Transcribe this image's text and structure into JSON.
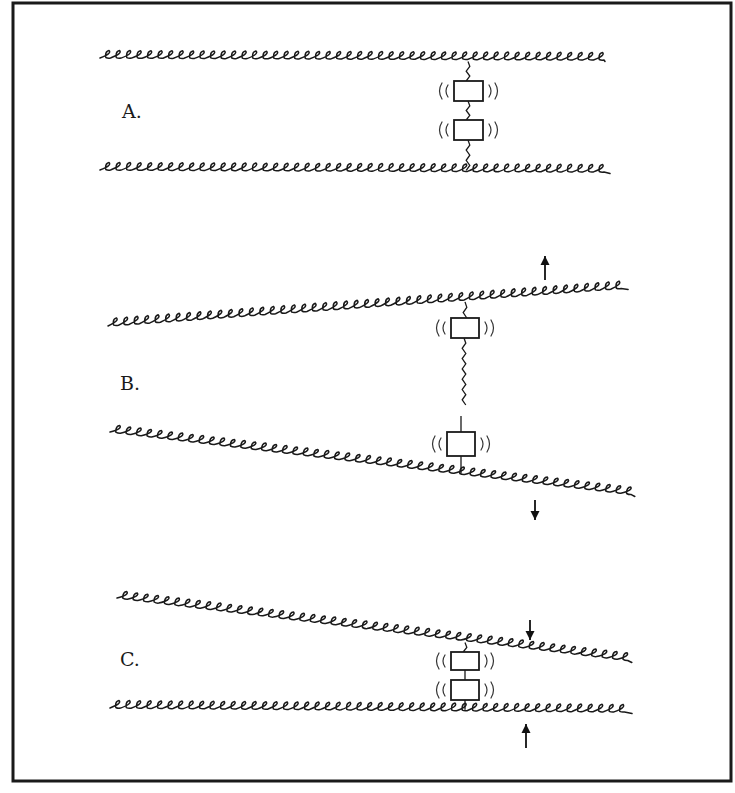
{
  "figure": {
    "border": {
      "x": 13,
      "y": 3,
      "width": 718,
      "height": 778,
      "color": "#1a1a1a"
    },
    "panels": [
      {
        "id": "A",
        "label": "A.",
        "label_pos": {
          "x": 122,
          "y": 100
        },
        "description": "Two parallel filaments linked by two vibrating blocks in series (contact state)",
        "filaments": [
          {
            "name": "top",
            "from": [
              100,
              58
            ],
            "to": [
              605,
              60
            ]
          },
          {
            "name": "bottom",
            "from": [
              100,
              170
            ],
            "to": [
              610,
              172
            ]
          }
        ],
        "blocks": [
          {
            "x": 454,
            "y": 81,
            "w": 29,
            "h": 20
          },
          {
            "x": 454,
            "y": 120,
            "w": 29,
            "h": 20
          }
        ],
        "tether_x": 468,
        "arrows": []
      },
      {
        "id": "B",
        "label": "B.",
        "label_pos": {
          "x": 120,
          "y": 372
        },
        "description": "Filaments pulled apart; the link between blocks is stretched",
        "filaments": [
          {
            "name": "top",
            "from": [
              108,
              326
            ],
            "to": [
              628,
              288
            ]
          },
          {
            "name": "bottom",
            "from": [
              110,
              432
            ],
            "to": [
              635,
              495
            ]
          }
        ],
        "blocks": [
          {
            "x": 451,
            "y": 318,
            "w": 28,
            "h": 20
          },
          {
            "x": 447,
            "y": 432,
            "w": 28,
            "h": 24
          }
        ],
        "tether_x": 465,
        "arrows": [
          {
            "direction": "up",
            "x": 545,
            "y1": 280,
            "y2": 256
          },
          {
            "direction": "down",
            "x": 535,
            "y1": 500,
            "y2": 520
          }
        ]
      },
      {
        "id": "C",
        "label": "C.",
        "label_pos": {
          "x": 120,
          "y": 648
        },
        "description": "Filaments pushed together; blocks compressed into contact",
        "filaments": [
          {
            "name": "top",
            "from": [
              117,
              598
            ],
            "to": [
              632,
              661
            ]
          },
          {
            "name": "bottom",
            "from": [
              110,
              708
            ],
            "to": [
              632,
              712
            ]
          }
        ],
        "blocks": [
          {
            "x": 451,
            "y": 652,
            "w": 28,
            "h": 18
          },
          {
            "x": 451,
            "y": 680,
            "w": 28,
            "h": 20
          }
        ],
        "tether_x": 465,
        "arrows": [
          {
            "direction": "down",
            "x": 530,
            "y1": 620,
            "y2": 640
          },
          {
            "direction": "up",
            "x": 526,
            "y1": 748,
            "y2": 724
          }
        ]
      }
    ]
  }
}
